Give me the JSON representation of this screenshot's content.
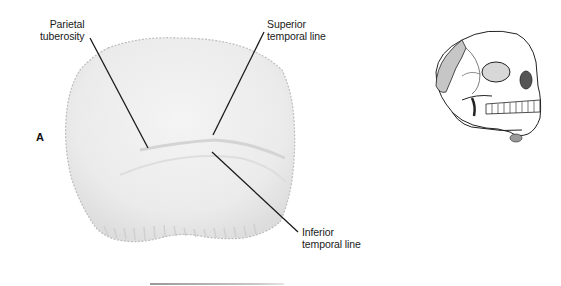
{
  "figure": {
    "panel_letter": "A",
    "labels": {
      "parietal_tuberosity": {
        "line1": "Parietal",
        "line2": "tuberosity"
      },
      "superior_temporal_line": {
        "line1": "Superior",
        "line2": "temporal line"
      },
      "inferior_temporal_line": {
        "line1": "Inferior",
        "line2": "temporal line"
      }
    },
    "colors": {
      "bone_fill": "#ececec",
      "bone_edge": "#b8b8b8",
      "leader_line": "#1a1a1a",
      "skull_highlight": "#c6c6c6",
      "rule": "#a8a8a8"
    }
  }
}
